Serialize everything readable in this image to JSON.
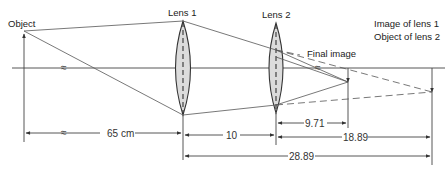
{
  "diagram": {
    "type": "two-lens optical ray diagram",
    "labels": {
      "object": "Object",
      "lens1": "Lens 1",
      "lens2": "Lens 2",
      "final_image": "Final image",
      "intermediate_line1": "Image of lens 1",
      "intermediate_line2": "Object of lens 2"
    },
    "break_symbol": "≈",
    "dimensions": {
      "object_to_lens1": "65 cm",
      "lens1_to_lens2": "10",
      "lens2_to_final_image": "9.71",
      "lens2_to_intermediate_image": "18.89",
      "lens1_to_intermediate_image": "28.89"
    },
    "colors": {
      "line": "#444444",
      "lens_fill": "#dcdcdc"
    }
  }
}
